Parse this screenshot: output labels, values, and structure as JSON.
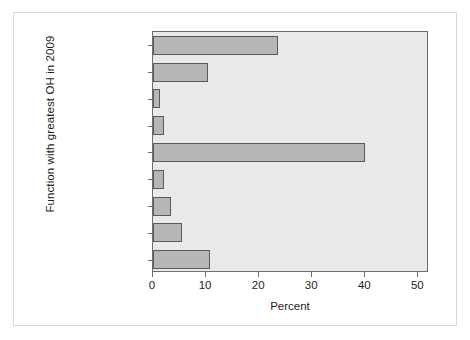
{
  "chart_data": {
    "type": "bar",
    "orientation": "horizontal",
    "title": "",
    "xlabel": "Percent",
    "ylabel": "Function with greatest OH in 2009",
    "xlim": [
      0,
      52
    ],
    "ylim": null,
    "grid": false,
    "legend": null,
    "xticks": [
      0,
      10,
      20,
      30,
      40,
      50
    ],
    "xtick_labels": [
      "0",
      "10",
      "20",
      "30",
      "40",
      "50"
    ],
    "categories": [
      "Operations management",
      "Proposal development",
      "Legal",
      "Purchasing",
      "Business development and marketing",
      "Quality assurance and control",
      "Contracts administration",
      "Human resources and recruiting",
      "Accounting and fiance"
    ],
    "category_label_lines": [
      [
        "Operations",
        "management"
      ],
      [
        "Proposal",
        "development"
      ],
      [
        "Legal"
      ],
      [
        "Purchasing"
      ],
      [
        "Business development",
        "and marketing"
      ],
      [
        "Quality assurance",
        "and control"
      ],
      [
        "Contracts",
        "administration"
      ],
      [
        "Human resources",
        "and recruiting"
      ],
      [
        "Accounting",
        "and fiance"
      ]
    ],
    "values": [
      23.5,
      10.4,
      1.3,
      2.0,
      40.0,
      2.0,
      3.4,
      5.5,
      10.8
    ],
    "bar_color": "#b6b6b6",
    "bar_edge_color": "#5a5a5a",
    "plot_background": "#e9e9e9",
    "axis_color": "#6d6d6d",
    "text_color": "#1d1d1d"
  }
}
